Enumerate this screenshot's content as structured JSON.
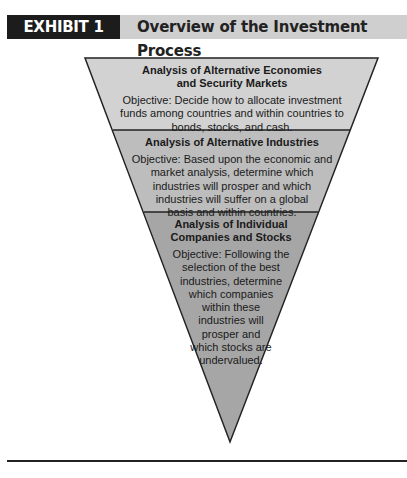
{
  "header": {
    "exhibit_label": "EXHIBIT 1",
    "title": "Overview of the Investment Process"
  },
  "colors": {
    "exhibit_bg": "#1c1c1c",
    "header_bg": "#cfcfcf",
    "band1_fill": "#d2d2d2",
    "band2_fill": "#bdbdbd",
    "band3_fill": "#a6a6a6",
    "outline": "#222222"
  },
  "funnel": {
    "bands": [
      {
        "title_line1": "Analysis of Alternative Economies",
        "title_line2": "and Security Markets",
        "objective_lines": [
          "Objective: Decide how to allocate investment",
          "funds among countries and within countries to",
          "bonds, stocks, and cash."
        ]
      },
      {
        "title_line1": "Analysis of Alternative Industries",
        "objective_lines": [
          "Objective: Based upon the economic and",
          "market analysis, determine which",
          "industries will prosper and which",
          "industries will suffer on a global",
          "basis and within countries."
        ]
      },
      {
        "title_line1": "Analysis of Individual",
        "title_line2": "Companies and Stocks",
        "objective_lines": [
          "Objective: Following the",
          "selection of the best",
          "industries, determine",
          "which companies",
          "within these",
          "industries will",
          "prosper and",
          "which stocks are",
          "undervalued."
        ]
      }
    ]
  }
}
